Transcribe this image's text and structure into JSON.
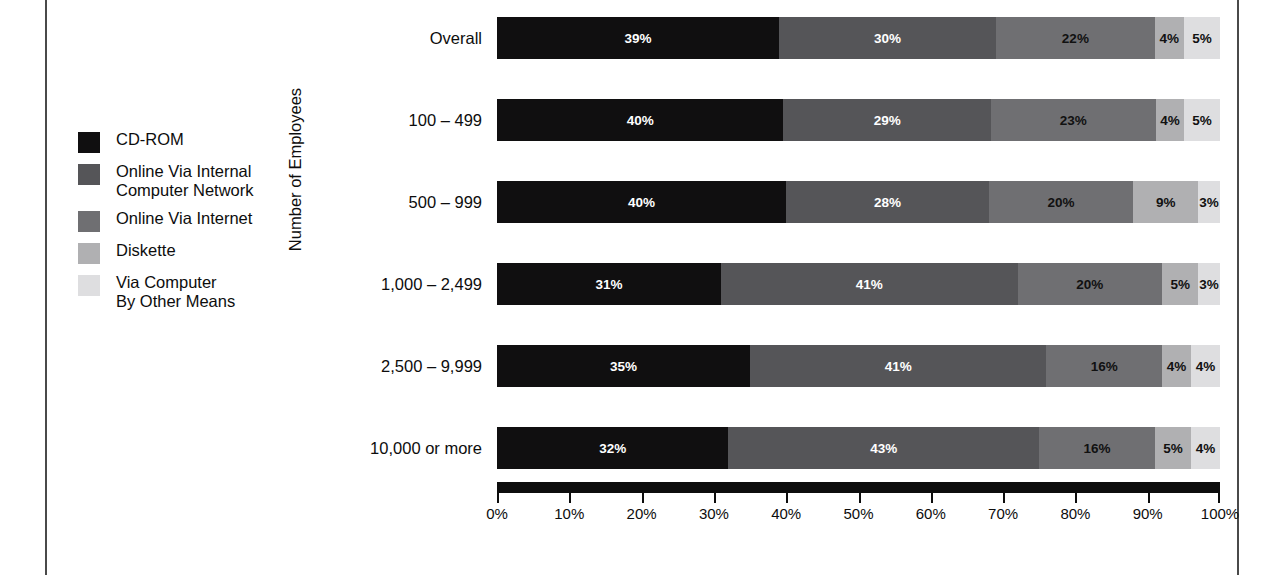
{
  "legend": {
    "items": [
      {
        "label": "CD-ROM",
        "color": "#100f10"
      },
      {
        "label": "Online Via Internal\nComputer Network",
        "color": "#555558"
      },
      {
        "label": "Online Via Internet",
        "color": "#6f6f72"
      },
      {
        "label": "Diskette",
        "color": "#b0b0b2"
      },
      {
        "label": "Via Computer\nBy Other Means",
        "color": "#dedee0"
      }
    ]
  },
  "axes": {
    "y_title": "Number of Employees",
    "x_tick_labels": [
      "0%",
      "10%",
      "20%",
      "30%",
      "40%",
      "50%",
      "60%",
      "70%",
      "80%",
      "90%",
      "100%"
    ]
  },
  "chart_data": {
    "type": "bar",
    "orientation": "horizontal",
    "stacked": true,
    "stack_total": 100,
    "title": "",
    "xlabel": "",
    "ylabel": "Number of Employees",
    "xlim": [
      0,
      100
    ],
    "grid": false,
    "legend_position": "left",
    "value_suffix": "%",
    "categories": [
      "Overall",
      "100 – 499",
      "500 – 999",
      "1,000 – 2,499",
      "2,500 – 9,999",
      "10,000 or more"
    ],
    "series": [
      {
        "name": "CD-ROM",
        "color": "#100f10",
        "values": [
          39,
          40,
          40,
          31,
          35,
          32
        ]
      },
      {
        "name": "Online Via Internal Computer Network",
        "color": "#555558",
        "values": [
          30,
          29,
          28,
          41,
          41,
          43
        ]
      },
      {
        "name": "Online Via Internet",
        "color": "#6f6f72",
        "values": [
          22,
          23,
          20,
          20,
          16,
          16
        ]
      },
      {
        "name": "Diskette",
        "color": "#b0b0b2",
        "values": [
          4,
          4,
          9,
          5,
          4,
          5
        ]
      },
      {
        "name": "Via Computer By Other Means",
        "color": "#dedee0",
        "values": [
          5,
          5,
          3,
          3,
          4,
          4
        ]
      }
    ],
    "data_labels": [
      [
        "39%",
        "30%",
        "22%",
        "4%",
        "5%"
      ],
      [
        "40%",
        "29%",
        "23%",
        "4%",
        "5%"
      ],
      [
        "40%",
        "28%",
        "20%",
        "9%",
        "3%"
      ],
      [
        "31%",
        "41%",
        "20%",
        "5%",
        "3%"
      ],
      [
        "35%",
        "41%",
        "16%",
        "4%",
        "4%"
      ],
      [
        "32%",
        "43%",
        "16%",
        "5%",
        "4%"
      ]
    ],
    "label_text_colors": [
      [
        "#ffffff",
        "#ffffff",
        "#111111",
        "#111111",
        "#111111"
      ],
      [
        "#ffffff",
        "#ffffff",
        "#111111",
        "#111111",
        "#111111"
      ],
      [
        "#ffffff",
        "#ffffff",
        "#111111",
        "#111111",
        "#111111"
      ],
      [
        "#ffffff",
        "#ffffff",
        "#111111",
        "#111111",
        "#111111"
      ],
      [
        "#ffffff",
        "#ffffff",
        "#111111",
        "#111111",
        "#111111"
      ],
      [
        "#ffffff",
        "#ffffff",
        "#111111",
        "#111111",
        "#111111"
      ]
    ]
  }
}
